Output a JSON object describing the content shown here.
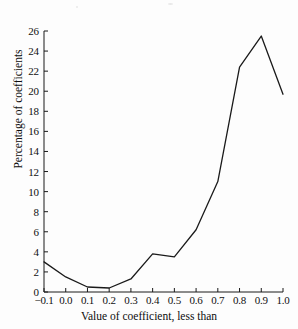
{
  "chart_data": {
    "type": "line",
    "title": "",
    "xlabel": "Value of coefficient, less than",
    "ylabel": "Percentage of coefficients",
    "x": [
      -0.1,
      0.0,
      0.1,
      0.2,
      0.3,
      0.4,
      0.5,
      0.6,
      0.7,
      0.8,
      0.9,
      1.0
    ],
    "values": [
      3.0,
      1.5,
      0.5,
      0.4,
      1.3,
      3.8,
      3.5,
      6.2,
      11.0,
      22.4,
      25.5,
      19.7
    ],
    "xlim": [
      -0.1,
      1.0
    ],
    "ylim": [
      0,
      26
    ],
    "xticks": [
      -0.1,
      0.0,
      0.1,
      0.2,
      0.3,
      0.4,
      0.5,
      0.6,
      0.7,
      0.8,
      0.9,
      1.0
    ],
    "xtick_labels": [
      "−0.1",
      "0.0",
      "0.1",
      "0.2",
      "0.3",
      "0.4",
      "0.5",
      "0.6",
      "0.7",
      "0.8",
      "0.9",
      "1.0"
    ],
    "yticks": [
      0,
      2,
      4,
      6,
      8,
      10,
      12,
      14,
      16,
      18,
      20,
      22,
      24,
      26
    ],
    "ytick_labels": [
      "0",
      "2",
      "4",
      "6",
      "8",
      "10",
      "12",
      "14",
      "16",
      "18",
      "20",
      "22",
      "24",
      "26"
    ],
    "grid": false,
    "legend": false,
    "line_color": "#1a1a1a",
    "background_color": "#fdfdfd"
  }
}
